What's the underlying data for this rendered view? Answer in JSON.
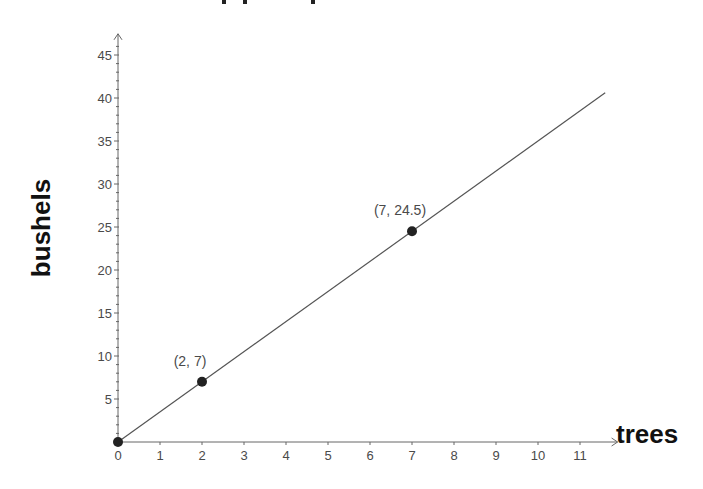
{
  "chart_data": {
    "type": "line",
    "title": "",
    "xlabel": "trees",
    "ylabel": "bushels",
    "x": [
      0,
      11.6
    ],
    "series": [
      {
        "name": "bushels = 3.5 × trees",
        "x": [
          0,
          11.6
        ],
        "values": [
          0,
          40.6
        ]
      }
    ],
    "points": [
      {
        "x": 0,
        "y": 0,
        "label": ""
      },
      {
        "x": 2,
        "y": 7,
        "label": "(2, 7)"
      },
      {
        "x": 7,
        "y": 24.5,
        "label": "(7, 24.5)"
      }
    ],
    "xticks": [
      "0",
      "1",
      "2",
      "3",
      "4",
      "5",
      "6",
      "7",
      "8",
      "9",
      "10",
      "11"
    ],
    "yticks": [
      "5",
      "10",
      "15",
      "20",
      "25",
      "30",
      "35",
      "40",
      "45"
    ],
    "xlim": [
      0,
      11.8
    ],
    "ylim": [
      0,
      47
    ],
    "grid": false,
    "legend": "none"
  },
  "colors": {
    "line": "#555555",
    "axis": "#666666",
    "point": "#222222",
    "text": "#4a4a4a",
    "axis_title": "#111111"
  }
}
